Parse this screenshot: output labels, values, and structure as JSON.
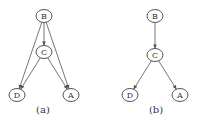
{
  "diagrams": [
    {
      "caption": "(a)",
      "caption_pos": [
        43,
        113
      ],
      "nodes": [
        {
          "id": "B",
          "label": "B",
          "x": 44,
          "y": 16
        },
        {
          "id": "C",
          "label": "C",
          "x": 44,
          "y": 52
        },
        {
          "id": "D",
          "label": "D",
          "x": 17,
          "y": 95
        },
        {
          "id": "A",
          "label": "A",
          "x": 71,
          "y": 95
        }
      ],
      "edges": [
        {
          "from": "B",
          "to": "C"
        },
        {
          "from": "B",
          "to": "D"
        },
        {
          "from": "B",
          "to": "A"
        },
        {
          "from": "C",
          "to": "D"
        },
        {
          "from": "C",
          "to": "A"
        }
      ]
    },
    {
      "caption": "(b)",
      "caption_pos": [
        156,
        113
      ],
      "nodes": [
        {
          "id": "B",
          "label": "B",
          "x": 155,
          "y": 16
        },
        {
          "id": "C",
          "label": "C",
          "x": 155,
          "y": 55
        },
        {
          "id": "D",
          "label": "D",
          "x": 130,
          "y": 95
        },
        {
          "id": "A",
          "label": "A",
          "x": 180,
          "y": 95
        }
      ],
      "edges": [
        {
          "from": "B",
          "to": "C"
        },
        {
          "from": "C",
          "to": "D"
        },
        {
          "from": "C",
          "to": "A"
        }
      ]
    }
  ],
  "style": {
    "node_rx": 8,
    "node_ry": 6.5,
    "edge_color": "#666666",
    "node_stroke": "#555555"
  }
}
